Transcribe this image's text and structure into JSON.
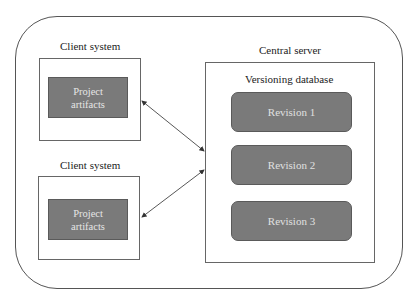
{
  "diagram": {
    "client_top": {
      "label": "Client system",
      "artifact": {
        "line1": "Project",
        "line2": "artifacts"
      }
    },
    "client_bottom": {
      "label": "Client system",
      "artifact": {
        "line1": "Project",
        "line2": "artifacts"
      }
    },
    "server": {
      "label": "Central server",
      "database_label": "Versioning database",
      "revisions": [
        "Revision 1",
        "Revision 2",
        "Revision 3"
      ]
    },
    "connections": [
      {
        "from": "client_top",
        "to": "server",
        "type": "bidirectional"
      },
      {
        "from": "client_bottom",
        "to": "server",
        "type": "bidirectional"
      }
    ],
    "colors": {
      "box_fill": "#7a7a7a",
      "box_text": "#e6e6e6",
      "line": "#555555"
    }
  }
}
